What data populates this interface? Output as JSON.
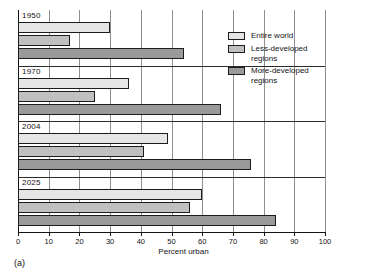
{
  "chart_data": {
    "type": "bar",
    "orientation": "horizontal",
    "title": "",
    "xlabel": "Percent urban",
    "ylabel": "",
    "xlim": [
      0,
      100
    ],
    "xticks": [
      0,
      10,
      20,
      30,
      40,
      50,
      60,
      70,
      80,
      90,
      100
    ],
    "grid": "vertical",
    "legend_position": "top-right",
    "categories": [
      "1950",
      "1970",
      "2004",
      "2025"
    ],
    "series": [
      {
        "name": "Entire world",
        "color": "#e6e6e6",
        "values": [
          30,
          36,
          49,
          60
        ]
      },
      {
        "name": "Less-developed regions",
        "color": "#c0c0c0",
        "values": [
          17,
          25,
          41,
          56
        ]
      },
      {
        "name": "More-developed regions",
        "color": "#9a9a9a",
        "values": [
          54,
          66,
          76,
          84
        ]
      }
    ],
    "annotations": [
      "(a)"
    ]
  },
  "figure": {
    "panel_letter": "(a)",
    "axis": {
      "xlabel": "Percent urban",
      "ticklabels": [
        "0",
        "10",
        "20",
        "30",
        "40",
        "50",
        "60",
        "70",
        "80",
        "90",
        "100"
      ]
    },
    "groups": [
      {
        "label": "1950"
      },
      {
        "label": "1970"
      },
      {
        "label": "2004"
      },
      {
        "label": "2025"
      }
    ],
    "legend": [
      {
        "label": "Entire world",
        "swatch": "entire"
      },
      {
        "label": "Less-developed\nregions",
        "swatch": "less"
      },
      {
        "label": "More-developed\nregions",
        "swatch": "more"
      }
    ]
  }
}
